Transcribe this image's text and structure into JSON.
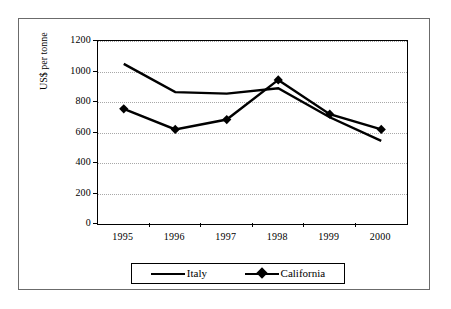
{
  "chart_data": {
    "type": "line",
    "title": "",
    "subtitle": "",
    "xlabel": "",
    "ylabel": "US$ per tonne",
    "categories": [
      "1995",
      "1996",
      "1997",
      "1998",
      "1999",
      "2000"
    ],
    "series": [
      {
        "name": "Italy",
        "marker": "none",
        "color": "#000000",
        "values": [
          1050,
          865,
          855,
          890,
          700,
          545
        ]
      },
      {
        "name": "California",
        "marker": "diamond",
        "color": "#000000",
        "values": [
          755,
          620,
          685,
          945,
          720,
          620
        ]
      }
    ],
    "ylim": [
      0,
      1200
    ],
    "ytick_values": [
      0,
      200,
      400,
      600,
      800,
      1000,
      1200
    ],
    "ytick_labels": [
      "0",
      "200",
      "400",
      "600",
      "800",
      "1000",
      "1200"
    ],
    "xtick_labels": [
      "1995",
      "1996",
      "1997",
      "1998",
      "1999",
      "2000"
    ],
    "grid": "horizontal-dotted",
    "legend_position": "bottom",
    "legend_entries": [
      "Italy",
      "California"
    ],
    "annotations": []
  },
  "legend": {
    "italy_label": "Italy",
    "california_label": "California"
  },
  "axes": {
    "y_title": "US$ per tonne"
  },
  "colors": {
    "series": "#000000",
    "gridline": "#a8a8a8",
    "axis": "#000000",
    "frame": "#6b6b6b",
    "background": "#ffffff"
  }
}
